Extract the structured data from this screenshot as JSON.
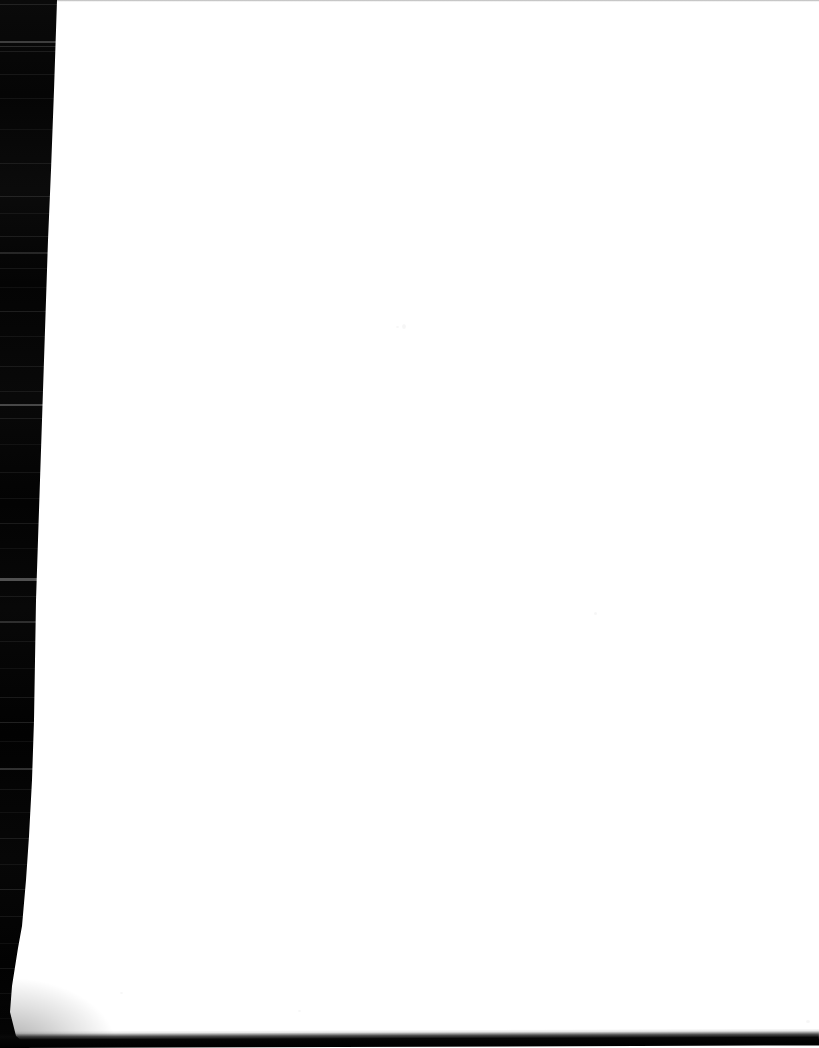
{
  "document": {
    "kind": "scanned-page",
    "caption": "Blank scanned page",
    "page_content_text": "",
    "width_px": 819,
    "height_px": 1048
  },
  "colors": {
    "scanner_background": "#030303",
    "page_paper": "#ffffff",
    "top_edge_line": "#787878",
    "bottom_edge_shadow": "#050505"
  },
  "page_geometry": {
    "left_edge_top_x": 57,
    "left_edge_bottom_x": 10,
    "bottom_edge_y": 1032,
    "top_edge_y": 0
  },
  "artifacts": {
    "streaks": [
      {
        "y": 4,
        "h": 1,
        "opacity": 0.1
      },
      {
        "y": 41,
        "h": 2,
        "opacity": 0.22
      },
      {
        "y": 46,
        "h": 1,
        "opacity": 0.14
      },
      {
        "y": 51,
        "h": 1,
        "opacity": 0.09
      },
      {
        "y": 74,
        "h": 1,
        "opacity": 0.07
      },
      {
        "y": 98,
        "h": 1,
        "opacity": 0.06
      },
      {
        "y": 129,
        "h": 1,
        "opacity": 0.05
      },
      {
        "y": 163,
        "h": 1,
        "opacity": 0.08
      },
      {
        "y": 196,
        "h": 1,
        "opacity": 0.11
      },
      {
        "y": 213,
        "h": 1,
        "opacity": 0.06
      },
      {
        "y": 236,
        "h": 1,
        "opacity": 0.09
      },
      {
        "y": 252,
        "h": 2,
        "opacity": 0.13
      },
      {
        "y": 268,
        "h": 1,
        "opacity": 0.07
      },
      {
        "y": 287,
        "h": 1,
        "opacity": 0.05
      },
      {
        "y": 311,
        "h": 1,
        "opacity": 0.1
      },
      {
        "y": 336,
        "h": 1,
        "opacity": 0.06
      },
      {
        "y": 366,
        "h": 1,
        "opacity": 0.08
      },
      {
        "y": 391,
        "h": 1,
        "opacity": 0.07
      },
      {
        "y": 404,
        "h": 2,
        "opacity": 0.26
      },
      {
        "y": 418,
        "h": 1,
        "opacity": 0.09
      },
      {
        "y": 444,
        "h": 1,
        "opacity": 0.05
      },
      {
        "y": 472,
        "h": 1,
        "opacity": 0.07
      },
      {
        "y": 498,
        "h": 1,
        "opacity": 0.06
      },
      {
        "y": 523,
        "h": 1,
        "opacity": 0.09
      },
      {
        "y": 548,
        "h": 1,
        "opacity": 0.05
      },
      {
        "y": 578,
        "h": 3,
        "opacity": 0.3
      },
      {
        "y": 596,
        "h": 1,
        "opacity": 0.08
      },
      {
        "y": 621,
        "h": 2,
        "opacity": 0.16
      },
      {
        "y": 641,
        "h": 1,
        "opacity": 0.07
      },
      {
        "y": 668,
        "h": 1,
        "opacity": 0.05
      },
      {
        "y": 697,
        "h": 1,
        "opacity": 0.09
      },
      {
        "y": 722,
        "h": 1,
        "opacity": 0.12
      },
      {
        "y": 741,
        "h": 1,
        "opacity": 0.06
      },
      {
        "y": 768,
        "h": 2,
        "opacity": 0.18
      },
      {
        "y": 789,
        "h": 1,
        "opacity": 0.07
      },
      {
        "y": 812,
        "h": 1,
        "opacity": 0.05
      },
      {
        "y": 838,
        "h": 1,
        "opacity": 0.09
      },
      {
        "y": 864,
        "h": 1,
        "opacity": 0.06
      },
      {
        "y": 889,
        "h": 1,
        "opacity": 0.11
      },
      {
        "y": 916,
        "h": 1,
        "opacity": 0.07
      },
      {
        "y": 943,
        "h": 1,
        "opacity": 0.05
      },
      {
        "y": 968,
        "h": 1,
        "opacity": 0.08
      },
      {
        "y": 993,
        "h": 1,
        "opacity": 0.06
      },
      {
        "y": 1018,
        "h": 1,
        "opacity": 0.04
      }
    ],
    "specks": [
      {
        "x": 402,
        "y": 324,
        "w": 4,
        "h": 5
      },
      {
        "x": 396,
        "y": 326,
        "w": 3,
        "h": 2
      },
      {
        "x": 594,
        "y": 612,
        "w": 3,
        "h": 3
      },
      {
        "x": 298,
        "y": 1010,
        "w": 3,
        "h": 2
      },
      {
        "x": 806,
        "y": 1020,
        "w": 4,
        "h": 3
      },
      {
        "x": 120,
        "y": 992,
        "w": 3,
        "h": 2
      }
    ]
  }
}
